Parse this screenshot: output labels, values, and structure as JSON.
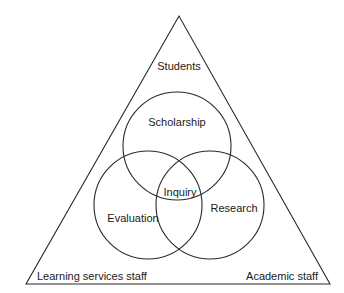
{
  "diagram": {
    "triangle": {
      "corners": {
        "top": "Students",
        "bottom_left": "Learning services staff",
        "bottom_right": "Academic staff"
      }
    },
    "circles": [
      {
        "id": "top",
        "label": "Scholarship"
      },
      {
        "id": "left",
        "label": "Evaluation"
      },
      {
        "id": "right",
        "label": "Research"
      }
    ],
    "center_label": "Inquiry"
  },
  "colors": {
    "line": "#2a2a2a",
    "text": "#1a1a1a",
    "background": "#ffffff"
  }
}
